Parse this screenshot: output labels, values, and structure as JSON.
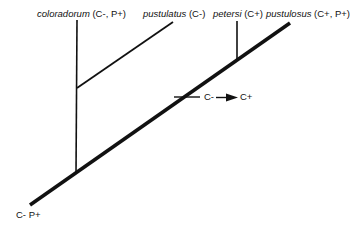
{
  "diagram": {
    "type": "cladogram",
    "taxa": [
      {
        "name": "coloradorum",
        "traits": "(C-, P+)"
      },
      {
        "name": "pustulatus",
        "traits": "(C-)"
      },
      {
        "name": "petersi",
        "traits": "(C+)"
      },
      {
        "name": "pustulosus",
        "traits": "(C+, P+)"
      }
    ],
    "root_label": "C- P+",
    "transition": {
      "from": "C-",
      "to": "C+"
    },
    "colors": {
      "line": "#111111",
      "background": "#ffffff"
    }
  }
}
